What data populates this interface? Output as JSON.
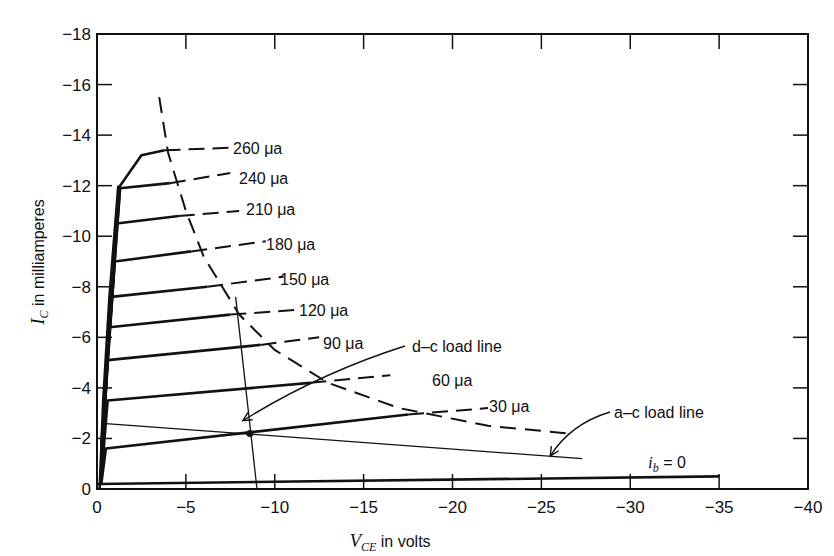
{
  "chart_data": {
    "type": "line",
    "title": "",
    "xlabel": "V_CE in volts",
    "ylabel": "I_C in milliamperes",
    "xlim": [
      0,
      -40
    ],
    "ylim": [
      0,
      -18
    ],
    "x_ticks": [
      0,
      -5,
      -10,
      -15,
      -20,
      -25,
      -30,
      -35,
      -40
    ],
    "x_tick_labels": [
      "0",
      "−5",
      "−10",
      "−15",
      "−20",
      "−25",
      "−30",
      "−35",
      "−40"
    ],
    "y_ticks": [
      0,
      -2,
      -4,
      -6,
      -8,
      -10,
      -12,
      -14,
      -16,
      -18
    ],
    "y_tick_labels": [
      "0",
      "−2",
      "−4",
      "−6",
      "−8",
      "−10",
      "−12",
      "−14",
      "−16",
      "−18"
    ],
    "grid": false,
    "legend": null,
    "series": [
      {
        "name": "i_b = 0",
        "label": "ib = 0",
        "style": "solid",
        "x": [
          0,
          -35
        ],
        "y": [
          -0.2,
          -0.5
        ]
      },
      {
        "name": "30 μa",
        "label": "30 μa",
        "style": "solid-then-dashed",
        "x": [
          -0.5,
          -17.5,
          -22
        ],
        "y": [
          -1.6,
          -2.95,
          -3.2
        ]
      },
      {
        "name": "60 μa",
        "label": "60 μa",
        "style": "solid-then-dashed",
        "x": [
          -0.6,
          -12,
          -16.5
        ],
        "y": [
          -3.5,
          -4.2,
          -4.5
        ]
      },
      {
        "name": "90 μa",
        "label": "90 μa",
        "style": "solid-then-dashed",
        "x": [
          -0.6,
          -9.2,
          -12.5
        ],
        "y": [
          -5.1,
          -5.7,
          -6.0
        ]
      },
      {
        "name": "120 μa",
        "label": "120 μa",
        "style": "solid-then-dashed",
        "x": [
          -0.7,
          -7.5,
          -11.5
        ],
        "y": [
          -6.4,
          -6.9,
          -7.1
        ]
      },
      {
        "name": "150 μa",
        "label": "150 μa",
        "style": "solid-then-dashed",
        "x": [
          -0.8,
          -6.2,
          -10.5
        ],
        "y": [
          -7.6,
          -8.0,
          -8.4
        ]
      },
      {
        "name": "180 μa",
        "label": "180 μa",
        "style": "solid-then-dashed",
        "x": [
          -1.0,
          -5.3,
          -9.5
        ],
        "y": [
          -9.0,
          -9.4,
          -9.8
        ]
      },
      {
        "name": "210 μa",
        "label": "210 μa",
        "style": "solid-then-dashed",
        "x": [
          -1.1,
          -4.6,
          -8.0
        ],
        "y": [
          -10.5,
          -10.8,
          -11.0
        ]
      },
      {
        "name": "240 μa",
        "label": "240 μa",
        "style": "solid-then-dashed",
        "x": [
          -1.3,
          -4.1,
          -7.5
        ],
        "y": [
          -11.9,
          -12.1,
          -12.5
        ]
      },
      {
        "name": "260 μa",
        "label": "260 μa",
        "style": "solid-then-dashed",
        "x": [
          -1.3,
          -2.5,
          -3.8,
          -7.5
        ],
        "y": [
          -12.0,
          -13.2,
          -13.4,
          -13.5
        ]
      },
      {
        "name": "max dissipation hyperbola",
        "style": "dashed",
        "x": [
          -3.5,
          -4.0,
          -5.0,
          -6.0,
          -8.0,
          -10.0,
          -13.0,
          -17.0,
          -22.0,
          -26.5
        ],
        "y": [
          -15.5,
          -13.3,
          -11.0,
          -9.2,
          -6.9,
          -5.5,
          -4.2,
          -3.2,
          -2.5,
          -2.2
        ]
      },
      {
        "name": "d-c load line",
        "style": "solid-thin",
        "x": [
          -7.8,
          -9.0
        ],
        "y": [
          -7.6,
          0
        ]
      },
      {
        "name": "a-c load line",
        "style": "solid-thin",
        "x": [
          -0.3,
          -27.3
        ],
        "y": [
          -2.6,
          -1.2
        ]
      }
    ],
    "annotations": [
      {
        "text": "d-c load line",
        "x": -17.5,
        "y": -6.0,
        "arrow_to": [
          -8.2,
          -2.7
        ]
      },
      {
        "text": "a-c load line",
        "x": -29.5,
        "y": -2.6,
        "arrow_to": [
          -25.5,
          -1.3
        ]
      },
      {
        "text": "i_b = 0",
        "x": -31.5,
        "y": -0.8
      },
      {
        "text": "Q point",
        "x": -8.6,
        "y": -2.2,
        "marker": "dot"
      }
    ]
  },
  "labels": {
    "y_axis_I": "I",
    "y_axis_sub": "C",
    "y_axis_rest": " in milliamperes",
    "x_axis_V": "V",
    "x_axis_sub": "CE",
    "x_axis_rest": "  in volts",
    "dc_load_line": "d–c load line",
    "ac_load_line": "a–c load line",
    "ib_i": "i",
    "ib_sub": "b",
    "ib_rest": " = 0"
  }
}
